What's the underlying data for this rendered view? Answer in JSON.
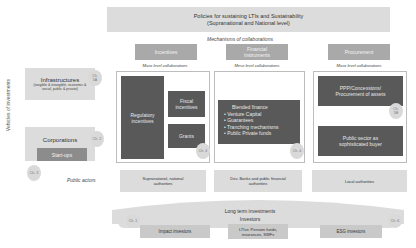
{
  "policy": {
    "line1": "Policies for sustaining LTIs and Sustainability",
    "line2": "(Supranational and National level)"
  },
  "mechanisms_label": "Mechanisms of collaborations",
  "vehicles_label": "Vehicles of investments",
  "public_actors_label": "Public actors",
  "columns": [
    {
      "header": "Incentives",
      "level": "Micro level collaborations",
      "boxes": [
        "Regulatory incentives",
        "Fiscal incentives",
        "Grants"
      ],
      "chapter": "Ch. 4",
      "actor": "Supranational, national authorities"
    },
    {
      "header_line1": "Financial",
      "header_line2": "instruments",
      "level": "Meso level collaborations",
      "box_title": "Blended finance",
      "bullets": [
        "Venture Capital",
        "Guarantees",
        "Tranching mechanisms",
        "Public Private funds"
      ],
      "chapter": "Ch. 4",
      "actor": "Dev. Banks and public financial authorities"
    },
    {
      "header": "Procurement",
      "level": "Micro level collaborations",
      "boxes": [
        "PPP/Concessions/ Procurement of assets",
        "Public sector as sophisticated buyer"
      ],
      "chapter": "Ch. 5B",
      "actor": "Local authorities"
    }
  ],
  "vehicles": {
    "infrastructures": {
      "title": "Infrastructures",
      "subtitle": "(tangible & intangible, economic & social, public & private)",
      "chapter": "Ch. 5A"
    },
    "corporations": {
      "title": "Corporations",
      "chapter": "Ch. 2",
      "startups": "Start-ups",
      "startups_chapter": "Ch. 3"
    }
  },
  "investors": {
    "line1": "Long term investments",
    "line2": "Investors",
    "chapter_left": "Ch. 1",
    "chapter_right": "Ch. 6",
    "items": [
      "Impact investors",
      "LTIvs: Pension funds, insurances, SWFs",
      "ESG investors"
    ]
  },
  "colors": {
    "light": "#dcdcdc",
    "mid": "#a9a9a9",
    "dark": "#595959"
  }
}
